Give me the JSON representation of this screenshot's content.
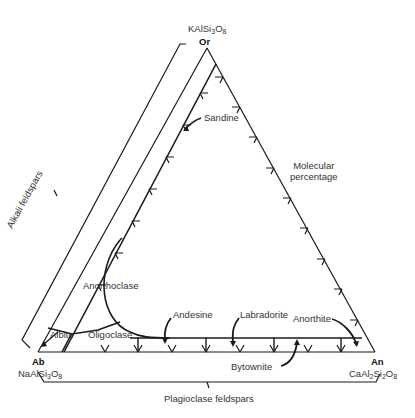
{
  "diagram": {
    "type": "ternary",
    "vertices": {
      "top": {
        "symbol": "Or",
        "formula_parts": [
          "KAlSi",
          "3",
          "O",
          "8"
        ]
      },
      "left": {
        "symbol": "Ab",
        "formula_parts": [
          "NaAlSi",
          "3",
          "O",
          "8"
        ]
      },
      "right": {
        "symbol": "An",
        "formula_parts": [
          "CaAl",
          "2",
          "Si",
          "2",
          "O",
          "8"
        ]
      }
    },
    "series_labels": {
      "alkali": "Alkali feldspars",
      "plagioclase": "Plagioclase feldspars"
    },
    "axis_note": [
      "Molecular",
      "percentage"
    ],
    "minerals": [
      "Sandine",
      "Anorthoclase",
      "Albite",
      "Oligoclase",
      "Andesine",
      "Labradorite",
      "Bytownite",
      "Anorthite"
    ],
    "colors": {
      "line": "#1a1a1a",
      "text": "#333333",
      "background": "#ffffff"
    }
  }
}
